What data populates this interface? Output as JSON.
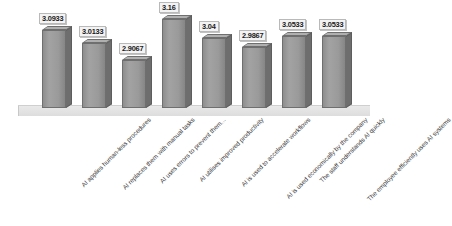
{
  "chart_data": {
    "type": "bar",
    "title": "",
    "subtitle": "",
    "xlabel": "",
    "ylabel": "",
    "grid": false,
    "legend": "none",
    "ylim": [
      0,
      3.3
    ],
    "style": "3d-column-chart",
    "categories": [
      "AI applies human-less procedures",
      "AI replaces them with manual tasks",
      "AI uses errors to prevent them...",
      "AI utilises improved productivity",
      "AI is used to accelerate workflows",
      "AI is used economically by the company",
      "The staff understands AI quickly",
      "The employee efficiently uses AI systems"
    ],
    "values": [
      3.0933,
      3.0133,
      2.9067,
      3.16,
      3.04,
      2.9867,
      3.0533,
      3.0533
    ],
    "value_labels": [
      "3.0933",
      "3.0133",
      "2.9067",
      "3.16",
      "3.04",
      "2.9867",
      "3.0533",
      "3.0533"
    ],
    "colors": {
      "bar_front": "#9a9a9a",
      "bar_side": "#6e6e6e",
      "bar_top": "#b0b0b0",
      "bar_outline": "#6f6f6f",
      "floor": "#e2e2e2",
      "label_box": "#f3f3f3",
      "label_text": "#1a1a1a",
      "background": "#ffffff"
    }
  }
}
